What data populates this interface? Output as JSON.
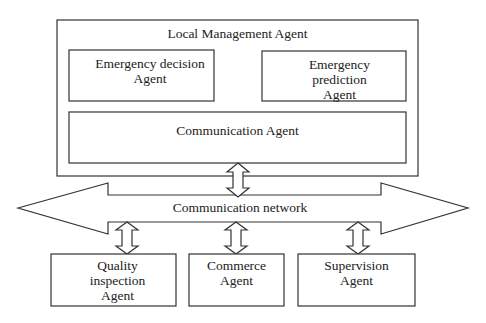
{
  "diagram": {
    "local_management": {
      "title": "Local Management Agent",
      "decision": "Emergency decision\nAgent",
      "prediction": "Emergency\nprediction\nAgent",
      "communication": "Communication Agent"
    },
    "network": {
      "label": "Communication network"
    },
    "agents": [
      {
        "label": "Quality\ninspection\nAgent"
      },
      {
        "label": "Commerce\nAgent"
      },
      {
        "label": "Supervision\nAgent"
      }
    ]
  }
}
